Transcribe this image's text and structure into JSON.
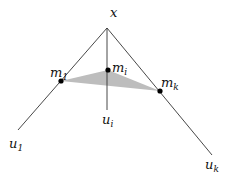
{
  "diagram": {
    "colors": {
      "line": "#333333",
      "fill": "#bdbdbd",
      "point": "#000000"
    },
    "apex": {
      "label": "x",
      "sub": "",
      "pos": [
        107,
        28
      ]
    },
    "rays": [
      {
        "id": "u1",
        "label": "u",
        "sub": "1",
        "end": [
          18,
          130
        ]
      },
      {
        "id": "ui",
        "label": "u",
        "sub": "i",
        "end": [
          107,
          110
        ]
      },
      {
        "id": "uk",
        "label": "u",
        "sub": "k",
        "end": [
          212,
          155
        ]
      }
    ],
    "points": [
      {
        "id": "m1",
        "label": "m",
        "sub": "1",
        "pos": [
          61,
          81
        ]
      },
      {
        "id": "mi",
        "label": "m",
        "sub": "i",
        "pos": [
          108,
          70
        ]
      },
      {
        "id": "mk",
        "label": "m",
        "sub": "k",
        "pos": [
          160,
          91
        ]
      }
    ]
  }
}
